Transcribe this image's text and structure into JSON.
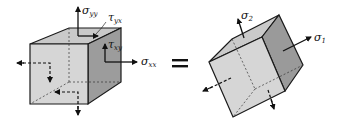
{
  "diagram": {
    "type": "stress-element-transformation",
    "left_element": {
      "description": "Cube under general plane stress",
      "labels": {
        "sigma_yy": {
          "symbol": "σ",
          "subscript": "yy"
        },
        "tau_yx": {
          "symbol": "τ",
          "subscript": "yx"
        },
        "tau_xy": {
          "symbol": "τ",
          "subscript": "xy"
        },
        "sigma_xx": {
          "symbol": "σ",
          "subscript": "xx"
        }
      }
    },
    "equals_sign": "=",
    "right_element": {
      "description": "Rotated cube under principal stresses",
      "labels": {
        "sigma_2": {
          "symbol": "σ",
          "subscript": "2"
        },
        "sigma_1": {
          "symbol": "σ",
          "subscript": "1"
        }
      }
    },
    "colors": {
      "front_face": "#d4d4d4",
      "top_face": "#c8c8c8",
      "side_face": "#9a9a9a",
      "edge": "#1a1a1a",
      "background": "#ffffff"
    }
  }
}
